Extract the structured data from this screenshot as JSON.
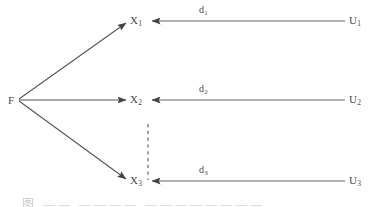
{
  "diagram": {
    "type": "node-link-diagram",
    "background_color": "#ffffff",
    "stroke_color": "#555555",
    "text_color": "#4a4a4a",
    "source_node": {
      "id": "F",
      "label": "F",
      "x": 11,
      "y": 100
    },
    "middle_nodes": [
      {
        "id": "X1",
        "label": "X",
        "subscript": "1",
        "x": 133,
        "y": 21
      },
      {
        "id": "X2",
        "label": "X",
        "subscript": "2",
        "x": 133,
        "y": 100
      },
      {
        "id": "X3",
        "label": "X",
        "subscript": "3",
        "x": 133,
        "y": 181
      }
    ],
    "right_nodes": [
      {
        "id": "U1",
        "label": "U",
        "subscript": "1",
        "x": 352,
        "y": 21
      },
      {
        "id": "U2",
        "label": "U",
        "subscript": "2",
        "x": 352,
        "y": 100
      },
      {
        "id": "U3",
        "label": "U",
        "subscript": "3",
        "x": 352,
        "y": 181
      }
    ],
    "edge_labels": [
      {
        "id": "d1",
        "label": "d",
        "subscript": "1",
        "x": 201,
        "y": 9
      },
      {
        "id": "d2",
        "label": "d",
        "subscript": "2",
        "x": 201,
        "y": 88
      },
      {
        "id": "d3",
        "label": "d",
        "subscript": "3",
        "x": 201,
        "y": 169
      }
    ],
    "fan_edges": [
      {
        "id": "F-to-X1",
        "from": "F",
        "to": "X1",
        "style": "solid",
        "arrow": "end"
      },
      {
        "id": "F-to-X2",
        "from": "F",
        "to": "X2",
        "style": "solid",
        "arrow": "end"
      },
      {
        "id": "F-to-X3",
        "from": "F",
        "to": "X3",
        "style": "solid",
        "arrow": "end"
      }
    ],
    "return_edges": [
      {
        "id": "U1-to-X1",
        "from": "U1",
        "to": "X1",
        "style": "solid",
        "arrow": "end",
        "label": "d1"
      },
      {
        "id": "U2-to-X2",
        "from": "U2",
        "to": "X2",
        "style": "solid",
        "arrow": "end",
        "label": "d2"
      },
      {
        "id": "U3-to-X3",
        "from": "U3",
        "to": "X3",
        "style": "solid",
        "arrow": "end",
        "label": "d3"
      }
    ],
    "ellipsis_connector": {
      "id": "vertical-dashed-ellipsis",
      "style": "dashed",
      "x": 148,
      "y_start": 124,
      "y_end": 180
    },
    "caption_fragment": "图  ——  ————  ————————"
  }
}
